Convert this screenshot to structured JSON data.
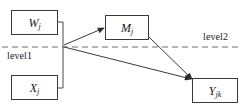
{
  "diagram": {
    "type": "multilevel-mediation-path-diagram",
    "nodes": [
      {
        "id": "w",
        "name": "predictor-w",
        "symbol": "W",
        "subscript": "j",
        "x": 11,
        "y": 10,
        "w": 47,
        "h": 25
      },
      {
        "id": "x",
        "name": "predictor-x",
        "symbol": "X",
        "subscript": "j",
        "x": 11,
        "y": 75,
        "w": 47,
        "h": 25
      },
      {
        "id": "m",
        "name": "mediator-m",
        "symbol": "M",
        "subscript": "j",
        "x": 105,
        "y": 15,
        "w": 44,
        "h": 25
      },
      {
        "id": "y",
        "name": "outcome-y",
        "symbol": "Y",
        "subscript": "jk",
        "x": 192,
        "y": 78,
        "w": 46,
        "h": 25
      }
    ],
    "level_labels": [
      {
        "id": "level1",
        "text": "level1",
        "x": 7,
        "y": 50
      },
      {
        "id": "level2",
        "text": "level2",
        "x": 203,
        "y": 31
      }
    ],
    "divider": {
      "name": "level-divider-dashed-line",
      "style": "dashed",
      "y": 47,
      "x_start": 2,
      "x_end": 242,
      "color": "#6e6e6e"
    },
    "edges": [
      {
        "id": "w-bracket",
        "name": "bracket-from-w",
        "arrow": false,
        "from": "w",
        "to": "junction"
      },
      {
        "id": "x-bracket",
        "name": "bracket-from-x",
        "arrow": false,
        "from": "x",
        "to": "junction"
      },
      {
        "id": "junction-m",
        "name": "arrow-junction-to-m",
        "arrow": true,
        "from": "junction",
        "to": "m"
      },
      {
        "id": "junction-y",
        "name": "arrow-junction-to-y",
        "arrow": true,
        "from": "junction",
        "to": "y"
      },
      {
        "id": "m-y",
        "name": "arrow-m-to-y",
        "arrow": true,
        "from": "m",
        "to": "y"
      }
    ],
    "colors": {
      "stroke": "#3a3a3a",
      "dashed": "#6e6e6e",
      "text": "#1a1a1a",
      "background": "#ffffff"
    }
  }
}
